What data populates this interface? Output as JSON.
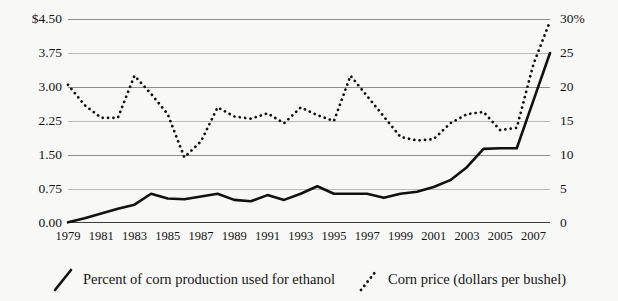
{
  "chart_data": {
    "type": "line",
    "title": "",
    "subtitle": "",
    "xlabel": "",
    "ylabel": "",
    "grid": true,
    "legend_position": "bottom",
    "x": [
      1979,
      1980,
      1981,
      1982,
      1983,
      1984,
      1985,
      1986,
      1987,
      1988,
      1989,
      1990,
      1991,
      1992,
      1993,
      1994,
      1995,
      1996,
      1997,
      1998,
      1999,
      2000,
      2001,
      2002,
      2003,
      2004,
      2005,
      2006,
      2007,
      2008
    ],
    "axes": {
      "left": {
        "label": "",
        "ticks": [
          "$4.50",
          "3.75",
          "3.00",
          "2.25",
          "1.50",
          "0.75",
          "0.00"
        ],
        "tick_values": [
          4.5,
          3.75,
          3.0,
          2.25,
          1.5,
          0.75,
          0.0
        ],
        "ylim": [
          0.0,
          4.5
        ],
        "units": "dollars per bushel"
      },
      "right": {
        "label": "",
        "ticks": [
          "30%",
          "25",
          "20",
          "15",
          "10",
          "5",
          "0"
        ],
        "tick_values": [
          30,
          25,
          20,
          15,
          10,
          5,
          0
        ],
        "ylim": [
          0,
          30
        ],
        "units": "percent"
      },
      "bottom": {
        "ticks": [
          "1979",
          "1981",
          "1983",
          "1985",
          "1987",
          "1989",
          "1991",
          "1993",
          "1995",
          "1997",
          "1999",
          "2001",
          "2003",
          "2005",
          "2007"
        ],
        "tick_values": [
          1979,
          1981,
          1983,
          1985,
          1987,
          1989,
          1991,
          1993,
          1995,
          1997,
          1999,
          2001,
          2003,
          2005,
          2007
        ],
        "xlim": [
          1979,
          2008
        ]
      }
    },
    "series": [
      {
        "name": "Percent of corn production used for ethanol",
        "axis": "right",
        "style": "solid",
        "color": "#111111",
        "values": [
          0.1,
          0.7,
          1.4,
          2.1,
          2.7,
          4.3,
          3.6,
          3.5,
          3.9,
          4.3,
          3.4,
          3.2,
          4.1,
          3.4,
          4.3,
          5.4,
          4.3,
          4.3,
          4.3,
          3.7,
          4.3,
          4.6,
          5.3,
          6.3,
          8.2,
          10.9,
          11.0,
          11.0,
          18.0,
          25.0
        ]
      },
      {
        "name": "Corn price (dollars per bushel)",
        "axis": "left",
        "style": "dotted",
        "color": "#111111",
        "values": [
          3.05,
          2.6,
          2.32,
          2.32,
          3.25,
          2.85,
          2.4,
          1.45,
          1.8,
          2.55,
          2.35,
          2.3,
          2.42,
          2.2,
          2.55,
          2.38,
          2.25,
          3.25,
          2.8,
          2.35,
          1.9,
          1.82,
          1.85,
          2.2,
          2.4,
          2.45,
          2.05,
          2.1,
          3.5,
          4.45
        ]
      }
    ],
    "legend": [
      {
        "label": "Percent of corn production used for ethanol",
        "style": "solid"
      },
      {
        "label": "Corn price (dollars per bushel)",
        "style": "dotted"
      }
    ]
  }
}
